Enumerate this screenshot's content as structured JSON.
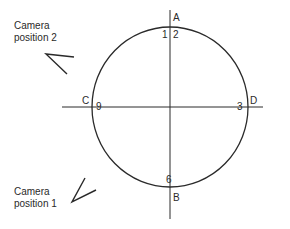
{
  "diagram": {
    "type": "camera-positions-around-circle",
    "stroke_color": "#2a2a2a",
    "background": "#ffffff",
    "circle": {
      "cx": 170,
      "cy": 107,
      "rx": 78,
      "ry": 80
    },
    "axes": {
      "vertical": {
        "x": 170,
        "y1": 10,
        "y2": 219
      },
      "horizontal": {
        "y": 107,
        "x1": 62,
        "x2": 263
      }
    },
    "points": {
      "A": "A",
      "B": "B",
      "C": "C",
      "D": "D"
    },
    "clock_marks": {
      "one": "1",
      "two": "2",
      "three": "3",
      "six": "6",
      "nine": "9"
    },
    "cameras": [
      {
        "id": "camera-2",
        "line1": "Camera",
        "line2": "position 2",
        "arrow": {
          "vertex": [
            46,
            54
          ],
          "arm1": [
            74,
            57
          ],
          "arm2": [
            67,
            74
          ]
        }
      },
      {
        "id": "camera-1",
        "line1": "Camera",
        "line2": "position 1",
        "arrow": {
          "vertex": [
            72,
            202
          ],
          "arm1": [
            85,
            178
          ],
          "arm2": [
            96,
            190
          ]
        }
      }
    ]
  }
}
